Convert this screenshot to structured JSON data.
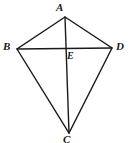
{
  "figure": {
    "shape_type": "kite",
    "canvas": {
      "width": 128,
      "height": 143
    },
    "colors": {
      "background": "#ffffff",
      "stroke": "#1a1a1a",
      "label": "#1a1a1a"
    },
    "stroke_width": 1.4,
    "points": {
      "A": {
        "label": "A",
        "x": 65,
        "y": 17
      },
      "B": {
        "label": "B",
        "x": 17,
        "y": 49
      },
      "C": {
        "label": "C",
        "x": 69,
        "y": 133
      },
      "D": {
        "label": "D",
        "x": 112,
        "y": 48
      },
      "E": {
        "label": "E",
        "x": 67,
        "y": 48
      }
    },
    "segments": [
      {
        "name": "side-AB",
        "from": "A",
        "to": "B"
      },
      {
        "name": "side-AD",
        "from": "A",
        "to": "D"
      },
      {
        "name": "side-BC",
        "from": "B",
        "to": "C"
      },
      {
        "name": "side-DC",
        "from": "D",
        "to": "C"
      },
      {
        "name": "diagonal-AC",
        "from": "A",
        "to": "C"
      },
      {
        "name": "diagonal-BD",
        "from": "B",
        "to": "D"
      }
    ],
    "labels": {
      "a": "A",
      "b": "B",
      "c": "C",
      "d": "D",
      "e": "E"
    }
  }
}
